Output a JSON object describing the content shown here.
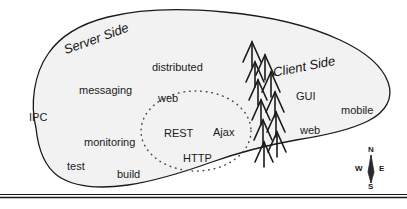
{
  "figure": {
    "name": "software-technology-island-map",
    "background_color": "#ffffff",
    "landmass_fill": "#f2f2f2",
    "outline_color": "#1a1a1a",
    "text_color": "#1a1a1a"
  },
  "regions": [
    {
      "id": "server-side",
      "label": "Server Side",
      "x": 62,
      "y": 44,
      "rotate": -20
    },
    {
      "id": "client-side",
      "label": "Client Side",
      "x": 272,
      "y": 66,
      "rotate": -11
    }
  ],
  "server_terms": [
    {
      "id": "distributed",
      "label": "distributed",
      "x": 152,
      "y": 62
    },
    {
      "id": "messaging",
      "label": "messaging",
      "x": 79,
      "y": 85
    },
    {
      "id": "ipc",
      "label": "IPC",
      "x": 29,
      "y": 112
    },
    {
      "id": "monitoring",
      "label": "monitoring",
      "x": 84,
      "y": 137
    },
    {
      "id": "test",
      "label": "test",
      "x": 67,
      "y": 161
    },
    {
      "id": "build",
      "label": "build",
      "x": 117,
      "y": 169
    }
  ],
  "shared_terms": [
    {
      "id": "web-shared",
      "label": "web",
      "x": 158,
      "y": 93
    },
    {
      "id": "rest",
      "label": "REST",
      "x": 164,
      "y": 128
    },
    {
      "id": "ajax",
      "label": "Ajax",
      "x": 213,
      "y": 127
    },
    {
      "id": "http",
      "label": "HTTP",
      "x": 183,
      "y": 153
    }
  ],
  "client_terms": [
    {
      "id": "gui",
      "label": "GUI",
      "x": 296,
      "y": 91
    },
    {
      "id": "mobile",
      "label": "mobile",
      "x": 341,
      "y": 105
    },
    {
      "id": "web-client",
      "label": "web",
      "x": 300,
      "y": 125
    }
  ],
  "compass": {
    "name": "compass-rose",
    "north": "N",
    "south": "S",
    "east": "E",
    "west": "W",
    "center_x": 371,
    "center_y": 170
  },
  "symbols": {
    "tree_count": 11,
    "tree_description": "chevron-tree-boundary-marks",
    "dotted_circle_description": "shared-web-technologies-zone"
  }
}
